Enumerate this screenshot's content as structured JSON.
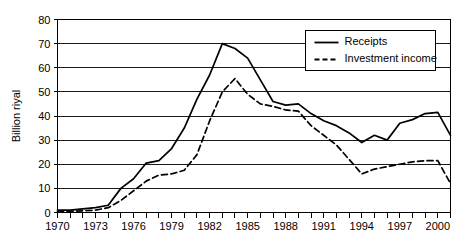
{
  "chart_data": {
    "type": "line",
    "title": "",
    "xlabel": "",
    "ylabel": "Billion riyal",
    "xlim": [
      1970,
      2001
    ],
    "ylim": [
      0,
      80
    ],
    "ytick_step": 10,
    "yticks": [
      0,
      10,
      20,
      30,
      40,
      50,
      60,
      70,
      80
    ],
    "ytick_labels": [
      "0",
      "10",
      "20",
      "30",
      "40",
      "50",
      "60",
      "70",
      "80"
    ],
    "xticks": [
      1970,
      1971,
      1972,
      1973,
      1974,
      1975,
      1976,
      1977,
      1978,
      1979,
      1980,
      1981,
      1982,
      1983,
      1984,
      1985,
      1986,
      1987,
      1988,
      1989,
      1990,
      1991,
      1992,
      1993,
      1994,
      1995,
      1996,
      1997,
      1998,
      1999,
      2000,
      2001
    ],
    "xtick_labels": [
      "1970",
      "1973",
      "1976",
      "1979",
      "1982",
      "1985",
      "1988",
      "1991",
      "1994",
      "1997",
      "2000"
    ],
    "xtick_label_values": [
      1970,
      1973,
      1976,
      1979,
      1982,
      1985,
      1988,
      1991,
      1994,
      1997,
      2000
    ],
    "grid": "horizontal",
    "legend_position": "top-right",
    "x": [
      1970,
      1971,
      1972,
      1973,
      1974,
      1975,
      1976,
      1977,
      1978,
      1979,
      1980,
      1981,
      1982,
      1983,
      1984,
      1985,
      1986,
      1987,
      1988,
      1989,
      1990,
      1991,
      1992,
      1993,
      1994,
      1995,
      1996,
      1997,
      1998,
      1999,
      2000,
      2001
    ],
    "series": [
      {
        "name": "Receipts",
        "style": "solid",
        "color": "#000000",
        "values": [
          1,
          1,
          1.5,
          2,
          3,
          10,
          14,
          20.5,
          21.5,
          26.5,
          35,
          47,
          57,
          70,
          68,
          64,
          55,
          46,
          44.5,
          45,
          41,
          38,
          36,
          33,
          29,
          32,
          30,
          37,
          38.5,
          41,
          41.5,
          32
        ]
      },
      {
        "name": "Investment income",
        "style": "dashed",
        "color": "#000000",
        "values": [
          0.5,
          0.5,
          0.7,
          1,
          2,
          5,
          9,
          13,
          15.5,
          16,
          17.5,
          24,
          38,
          50,
          55.5,
          49,
          45,
          44,
          42.5,
          42,
          36,
          32,
          28,
          22,
          16,
          18,
          19,
          20,
          21,
          21.5,
          21.5,
          12
        ]
      }
    ]
  },
  "legend": {
    "items": [
      {
        "label": "Receipts",
        "style": "solid"
      },
      {
        "label": "Investment income",
        "style": "dashed"
      }
    ]
  }
}
